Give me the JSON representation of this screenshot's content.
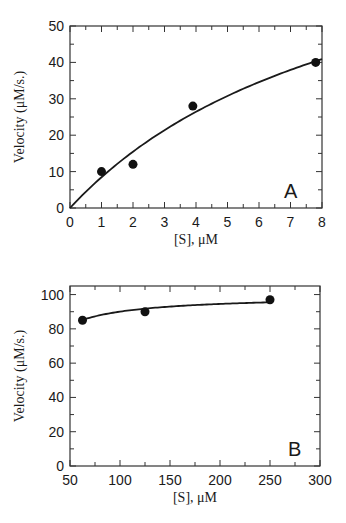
{
  "chart_data": [
    {
      "panel": "A",
      "type": "scatter",
      "title": "",
      "xlabel": "[S], μM",
      "ylabel": "Velocity (μM/s.)",
      "xlim": [
        0,
        8
      ],
      "ylim": [
        0,
        50
      ],
      "xticks": [
        0,
        1,
        2,
        3,
        4,
        5,
        6,
        7,
        8
      ],
      "yticks": [
        0,
        10,
        20,
        30,
        40,
        50
      ],
      "x_minor_step": 0.5,
      "y_minor_step": 5,
      "grid": false,
      "series": [
        {
          "name": "data",
          "type": "scatter",
          "x": [
            1,
            2,
            3.9,
            7.8
          ],
          "y": [
            10,
            12,
            28,
            40
          ]
        },
        {
          "name": "fit",
          "type": "line",
          "model": "michaelis-menten",
          "vmax": 90.5,
          "km": 9.7
        }
      ],
      "annotations": [
        "A"
      ]
    },
    {
      "panel": "B",
      "type": "scatter",
      "title": "",
      "xlabel": "[S], μM",
      "ylabel": "Velocity (μM/s.)",
      "xlim": [
        50,
        300
      ],
      "ylim": [
        0,
        105
      ],
      "xticks": [
        50,
        100,
        150,
        200,
        250,
        300
      ],
      "yticks": [
        0,
        20,
        40,
        60,
        80,
        100
      ],
      "x_minor_step": 25,
      "y_minor_step": 10,
      "grid": false,
      "series": [
        {
          "name": "data",
          "type": "scatter",
          "x": [
            62.5,
            125,
            250
          ],
          "y": [
            85,
            90,
            97
          ]
        },
        {
          "name": "fit",
          "type": "line",
          "model": "michaelis-menten",
          "vmax": 99.5,
          "km": 10.5
        }
      ],
      "annotations": [
        "B"
      ]
    }
  ]
}
